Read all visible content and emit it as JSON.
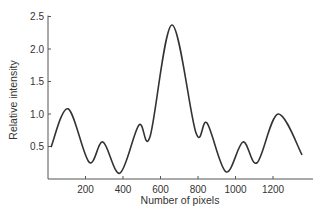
{
  "chart_data": {
    "type": "line",
    "title": "",
    "xlabel": "Number of pixels",
    "ylabel": "Relative intensity",
    "xlim": [
      0,
      1400
    ],
    "ylim": [
      0,
      2.5
    ],
    "xticks": [
      200,
      400,
      600,
      800,
      1000,
      1200
    ],
    "yticks": [
      0.5,
      1.0,
      1.5,
      2.0,
      2.5
    ],
    "xtick_labels": [
      "200",
      "400",
      "600",
      "800",
      "1000",
      "1200"
    ],
    "ytick_labels": [
      "0.5",
      "1.0",
      "1.5",
      "2.0",
      "2.5"
    ],
    "grid": false,
    "legend": null,
    "series": [
      {
        "name": "intensity",
        "color": "#333333",
        "x": [
          16,
          107,
          219,
          293,
          384,
          485,
          544,
          661,
          789,
          848,
          949,
          1040,
          1115,
          1227,
          1355
        ],
        "values": [
          0.49,
          1.08,
          0.26,
          0.57,
          0.09,
          0.83,
          0.65,
          2.37,
          0.71,
          0.86,
          0.11,
          0.57,
          0.25,
          1.0,
          0.37
        ]
      }
    ]
  }
}
